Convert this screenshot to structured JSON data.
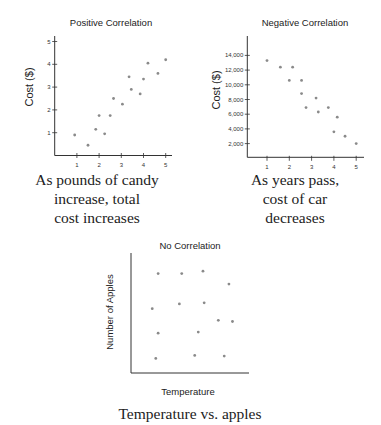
{
  "chart_data": [
    {
      "type": "scatter",
      "title": "Positive Correlation",
      "xlabel": "",
      "ylabel": "Cost ($)",
      "xlim": [
        0,
        5.3
      ],
      "ylim": [
        0,
        5.2
      ],
      "xticks": [
        1,
        2,
        3,
        4,
        5
      ],
      "yticks": [
        1,
        2,
        3,
        4,
        5
      ],
      "xtick_labels": [
        "1",
        "2",
        "3",
        "4",
        "5"
      ],
      "ytick_labels": [
        "1",
        "2",
        "3",
        "4",
        "5"
      ],
      "grid": false,
      "points": [
        {
          "x": 0.9,
          "y": 0.9
        },
        {
          "x": 1.5,
          "y": 0.45
        },
        {
          "x": 1.85,
          "y": 1.15
        },
        {
          "x": 2.0,
          "y": 1.75
        },
        {
          "x": 2.25,
          "y": 0.95
        },
        {
          "x": 2.5,
          "y": 1.75
        },
        {
          "x": 2.65,
          "y": 2.5
        },
        {
          "x": 3.05,
          "y": 2.25
        },
        {
          "x": 3.35,
          "y": 3.45
        },
        {
          "x": 3.45,
          "y": 2.9
        },
        {
          "x": 3.85,
          "y": 2.7
        },
        {
          "x": 4.0,
          "y": 3.35
        },
        {
          "x": 4.2,
          "y": 4.05
        },
        {
          "x": 4.65,
          "y": 3.6
        },
        {
          "x": 5.0,
          "y": 4.2
        }
      ],
      "caption": [
        "As pounds of candy",
        "increase, total",
        "cost increases"
      ]
    },
    {
      "type": "scatter",
      "title": "Negative Correlation",
      "xlabel": "",
      "ylabel": "Cost ($)",
      "xlim": [
        0,
        5.35
      ],
      "ylim": [
        0,
        16500
      ],
      "xticks": [
        1,
        2,
        3,
        4,
        5
      ],
      "yticks": [
        2000,
        4000,
        6000,
        8000,
        10000,
        12000,
        14000
      ],
      "xtick_labels": [
        "1",
        "2",
        "3",
        "4",
        "5"
      ],
      "ytick_labels": [
        "2,000",
        "4,000",
        "6,000",
        "8,000",
        "10,000",
        "12,000",
        "14,000"
      ],
      "grid": false,
      "points": [
        {
          "x": 1.0,
          "y": 13300
        },
        {
          "x": 1.6,
          "y": 12400
        },
        {
          "x": 2.15,
          "y": 12400
        },
        {
          "x": 2.0,
          "y": 10600
        },
        {
          "x": 2.55,
          "y": 10600
        },
        {
          "x": 2.55,
          "y": 8800
        },
        {
          "x": 2.75,
          "y": 6900
        },
        {
          "x": 3.2,
          "y": 8200
        },
        {
          "x": 3.3,
          "y": 6300
        },
        {
          "x": 3.75,
          "y": 6900
        },
        {
          "x": 4.15,
          "y": 5600
        },
        {
          "x": 4.0,
          "y": 3600
        },
        {
          "x": 4.5,
          "y": 3000
        },
        {
          "x": 5.0,
          "y": 2000
        }
      ],
      "caption": [
        "As years pass,",
        "cost of car",
        "decreases"
      ]
    },
    {
      "type": "scatter",
      "title": "No Correlation",
      "xlabel": "Temperature",
      "ylabel": "Number of Apples",
      "xlim": [
        0,
        10
      ],
      "ylim": [
        0,
        10
      ],
      "xticks": [],
      "yticks": [],
      "grid": false,
      "points": [
        {
          "x": 2.3,
          "y": 8.5
        },
        {
          "x": 4.3,
          "y": 8.5
        },
        {
          "x": 6.1,
          "y": 8.7
        },
        {
          "x": 8.3,
          "y": 7.6
        },
        {
          "x": 1.8,
          "y": 5.5
        },
        {
          "x": 4.1,
          "y": 5.9
        },
        {
          "x": 6.2,
          "y": 6.0
        },
        {
          "x": 7.4,
          "y": 4.5
        },
        {
          "x": 8.6,
          "y": 4.4
        },
        {
          "x": 2.3,
          "y": 3.4
        },
        {
          "x": 5.7,
          "y": 3.5
        },
        {
          "x": 2.1,
          "y": 1.25
        },
        {
          "x": 5.4,
          "y": 1.5
        },
        {
          "x": 7.9,
          "y": 1.45
        }
      ],
      "caption": [
        "Temperature vs. apples"
      ]
    }
  ],
  "colors": {
    "background": "#ffffff",
    "axis": "#333333",
    "point": "#8a8a8a",
    "text": "#222222"
  }
}
